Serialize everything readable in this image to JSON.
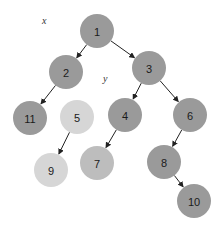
{
  "diagram": {
    "type": "binary-tree",
    "labels": [
      {
        "id": "x",
        "text": "x",
        "x": 42,
        "y": 24
      },
      {
        "id": "y",
        "text": "y",
        "x": 103,
        "y": 82
      }
    ],
    "colors": {
      "dark": "#9a9a9a",
      "light": "#d6d6d6",
      "mid": "#bdbdbd",
      "edge": "#222222"
    },
    "nodes": [
      {
        "id": "1",
        "label": "1",
        "cx": 97,
        "cy": 31,
        "shade": "dark"
      },
      {
        "id": "2",
        "label": "2",
        "cx": 66,
        "cy": 72,
        "shade": "dark"
      },
      {
        "id": "3",
        "label": "3",
        "cx": 149,
        "cy": 68,
        "shade": "dark"
      },
      {
        "id": "11",
        "label": "11",
        "cx": 30,
        "cy": 118,
        "shade": "dark"
      },
      {
        "id": "5",
        "label": "5",
        "cx": 77,
        "cy": 117,
        "shade": "light"
      },
      {
        "id": "4",
        "label": "4",
        "cx": 125,
        "cy": 115,
        "shade": "dark"
      },
      {
        "id": "6",
        "label": "6",
        "cx": 190,
        "cy": 115,
        "shade": "dark"
      },
      {
        "id": "9",
        "label": "9",
        "cx": 51,
        "cy": 170,
        "shade": "light"
      },
      {
        "id": "7",
        "label": "7",
        "cx": 97,
        "cy": 163,
        "shade": "mid"
      },
      {
        "id": "8",
        "label": "8",
        "cx": 164,
        "cy": 162,
        "shade": "dark"
      },
      {
        "id": "10",
        "label": "10",
        "cx": 194,
        "cy": 201,
        "shade": "dark"
      }
    ],
    "edges": [
      {
        "from": "1",
        "to": "2",
        "arrow": true
      },
      {
        "from": "1",
        "to": "3",
        "arrow": true
      },
      {
        "from": "2",
        "to": "11",
        "arrow": true
      },
      {
        "from": "3",
        "to": "4",
        "arrow": true
      },
      {
        "from": "3",
        "to": "6",
        "arrow": true
      },
      {
        "from": "5",
        "to": "9",
        "arrow": true
      },
      {
        "from": "4",
        "to": "7",
        "arrow": true
      },
      {
        "from": "6",
        "to": "8",
        "arrow": true
      },
      {
        "from": "8",
        "to": "10",
        "arrow": true
      }
    ],
    "node_radius": 17
  }
}
